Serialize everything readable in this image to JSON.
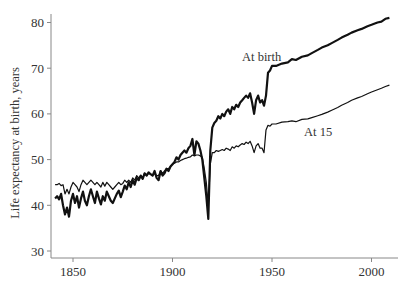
{
  "chart_data": {
    "type": "line",
    "title": "",
    "xlabel": "",
    "ylabel": "Life expectancy at birth, years",
    "xlim": [
      1840,
      2010
    ],
    "ylim": [
      30,
      82
    ],
    "x_ticks": [
      1850,
      1900,
      1950,
      2000
    ],
    "y_ticks": [
      30,
      40,
      50,
      60,
      70,
      80
    ],
    "grid": false,
    "legend": "none (inline annotations)",
    "annotations": [
      {
        "text": "At birth",
        "x": 1937,
        "y": 71.5
      },
      {
        "text": "At 15",
        "x": 1962,
        "y": 53.5
      }
    ],
    "series": [
      {
        "name": "At birth",
        "stroke_width": 2.2,
        "color": "#111111",
        "points": [
          [
            1841,
            41.5
          ],
          [
            1842,
            42
          ],
          [
            1843,
            41.3
          ],
          [
            1844,
            42.5
          ],
          [
            1845,
            40
          ],
          [
            1846,
            38
          ],
          [
            1847,
            39.5
          ],
          [
            1848,
            37.5
          ],
          [
            1849,
            41
          ],
          [
            1850,
            42.5
          ],
          [
            1851,
            40.5
          ],
          [
            1852,
            42
          ],
          [
            1853,
            39.5
          ],
          [
            1854,
            41.5
          ],
          [
            1855,
            43
          ],
          [
            1856,
            41
          ],
          [
            1857,
            40
          ],
          [
            1858,
            42
          ],
          [
            1859,
            43.5
          ],
          [
            1860,
            42
          ],
          [
            1861,
            40.5
          ],
          [
            1862,
            43
          ],
          [
            1863,
            41.5
          ],
          [
            1864,
            40.2
          ],
          [
            1865,
            42
          ],
          [
            1866,
            41
          ],
          [
            1867,
            43
          ],
          [
            1868,
            42
          ],
          [
            1869,
            41
          ],
          [
            1870,
            40.5
          ],
          [
            1871,
            41.5
          ],
          [
            1872,
            42.5
          ],
          [
            1873,
            43.2
          ],
          [
            1874,
            41.8
          ],
          [
            1875,
            43
          ],
          [
            1876,
            44.3
          ],
          [
            1877,
            43.5
          ],
          [
            1878,
            45
          ],
          [
            1879,
            44
          ],
          [
            1880,
            45.5
          ],
          [
            1881,
            44.5
          ],
          [
            1882,
            46
          ],
          [
            1883,
            45.5
          ],
          [
            1884,
            46.5
          ],
          [
            1885,
            45.8
          ],
          [
            1886,
            47
          ],
          [
            1887,
            46.5
          ],
          [
            1888,
            47.2
          ],
          [
            1889,
            46.8
          ],
          [
            1890,
            46.5
          ],
          [
            1891,
            47.5
          ],
          [
            1892,
            46
          ],
          [
            1893,
            45.5
          ],
          [
            1894,
            47.5
          ],
          [
            1895,
            46.5
          ],
          [
            1896,
            47
          ],
          [
            1897,
            48
          ],
          [
            1898,
            47.5
          ],
          [
            1899,
            48.5
          ],
          [
            1900,
            49
          ],
          [
            1901,
            49.5
          ],
          [
            1902,
            50.5
          ],
          [
            1903,
            50
          ],
          [
            1904,
            51
          ],
          [
            1905,
            51.5
          ],
          [
            1906,
            52
          ],
          [
            1907,
            51.5
          ],
          [
            1908,
            52.5
          ],
          [
            1909,
            53
          ],
          [
            1910,
            54.5
          ],
          [
            1911,
            51
          ],
          [
            1912,
            54
          ],
          [
            1913,
            53.5
          ],
          [
            1914,
            52
          ],
          [
            1915,
            50
          ],
          [
            1916,
            46
          ],
          [
            1917,
            42
          ],
          [
            1918,
            37
          ],
          [
            1919,
            52
          ],
          [
            1920,
            57
          ],
          [
            1921,
            58
          ],
          [
            1922,
            58.5
          ],
          [
            1923,
            59.5
          ],
          [
            1924,
            59
          ],
          [
            1925,
            60
          ],
          [
            1926,
            59.5
          ],
          [
            1927,
            60.5
          ],
          [
            1928,
            61
          ],
          [
            1929,
            60
          ],
          [
            1930,
            61.5
          ],
          [
            1931,
            61
          ],
          [
            1932,
            62
          ],
          [
            1933,
            61.5
          ],
          [
            1934,
            62.5
          ],
          [
            1935,
            63
          ],
          [
            1936,
            63.5
          ],
          [
            1937,
            64
          ],
          [
            1938,
            63.5
          ],
          [
            1939,
            64.5
          ],
          [
            1940,
            62.5
          ],
          [
            1941,
            60
          ],
          [
            1942,
            63
          ],
          [
            1943,
            64
          ],
          [
            1944,
            62.5
          ],
          [
            1945,
            63
          ],
          [
            1946,
            61.8
          ],
          [
            1947,
            64
          ],
          [
            1948,
            69
          ],
          [
            1949,
            69.5
          ],
          [
            1950,
            70.5
          ],
          [
            1952,
            70.5
          ],
          [
            1955,
            71
          ],
          [
            1958,
            71.3
          ],
          [
            1960,
            72
          ],
          [
            1962,
            71.8
          ],
          [
            1965,
            72.5
          ],
          [
            1968,
            72.8
          ],
          [
            1970,
            73.3
          ],
          [
            1973,
            74
          ],
          [
            1975,
            74.5
          ],
          [
            1978,
            75
          ],
          [
            1980,
            75.5
          ],
          [
            1983,
            76.2
          ],
          [
            1985,
            76.7
          ],
          [
            1988,
            77.3
          ],
          [
            1990,
            77.8
          ],
          [
            1993,
            78.3
          ],
          [
            1995,
            78.6
          ],
          [
            1998,
            79.2
          ],
          [
            2000,
            79.5
          ],
          [
            2003,
            80
          ],
          [
            2005,
            80.2
          ],
          [
            2007,
            80.8
          ],
          [
            2009,
            81
          ]
        ]
      },
      {
        "name": "At 15",
        "stroke_width": 1.2,
        "color": "#111111",
        "points": [
          [
            1841,
            44.5
          ],
          [
            1842,
            44.5
          ],
          [
            1843,
            44.8
          ],
          [
            1844,
            44.3
          ],
          [
            1845,
            44.5
          ],
          [
            1846,
            42.5
          ],
          [
            1847,
            43.5
          ],
          [
            1848,
            42.5
          ],
          [
            1849,
            44
          ],
          [
            1850,
            45
          ],
          [
            1851,
            44.5
          ],
          [
            1852,
            44
          ],
          [
            1853,
            43
          ],
          [
            1854,
            44.5
          ],
          [
            1855,
            45.5
          ],
          [
            1856,
            45
          ],
          [
            1857,
            44.5
          ],
          [
            1858,
            45
          ],
          [
            1859,
            45.5
          ],
          [
            1860,
            45
          ],
          [
            1861,
            44.5
          ],
          [
            1862,
            45
          ],
          [
            1863,
            44.5
          ],
          [
            1864,
            44
          ],
          [
            1865,
            45
          ],
          [
            1866,
            44.2
          ],
          [
            1867,
            45
          ],
          [
            1868,
            44.5
          ],
          [
            1869,
            44
          ],
          [
            1870,
            43.5
          ],
          [
            1871,
            44
          ],
          [
            1872,
            44.5
          ],
          [
            1873,
            45
          ],
          [
            1874,
            44.5
          ],
          [
            1875,
            44.8
          ],
          [
            1876,
            45.5
          ],
          [
            1877,
            45
          ],
          [
            1878,
            45.5
          ],
          [
            1879,
            45
          ],
          [
            1880,
            46
          ],
          [
            1881,
            45.5
          ],
          [
            1882,
            46.5
          ],
          [
            1883,
            46
          ],
          [
            1884,
            46.5
          ],
          [
            1885,
            46
          ],
          [
            1886,
            47
          ],
          [
            1887,
            46.5
          ],
          [
            1888,
            47
          ],
          [
            1889,
            46.8
          ],
          [
            1890,
            46.5
          ],
          [
            1891,
            47
          ],
          [
            1892,
            46.5
          ],
          [
            1893,
            46.5
          ],
          [
            1894,
            47.5
          ],
          [
            1895,
            47
          ],
          [
            1896,
            47.5
          ],
          [
            1897,
            48
          ],
          [
            1898,
            48
          ],
          [
            1899,
            48.5
          ],
          [
            1900,
            49
          ],
          [
            1901,
            49.2
          ],
          [
            1902,
            49.5
          ],
          [
            1903,
            49.5
          ],
          [
            1904,
            49.8
          ],
          [
            1905,
            50
          ],
          [
            1906,
            50.2
          ],
          [
            1907,
            50.3
          ],
          [
            1908,
            50.5
          ],
          [
            1909,
            50.6
          ],
          [
            1910,
            51
          ],
          [
            1911,
            50.8
          ],
          [
            1912,
            51
          ],
          [
            1913,
            51
          ],
          [
            1914,
            50.8
          ],
          [
            1915,
            50.5
          ],
          [
            1916,
            48
          ],
          [
            1917,
            45
          ],
          [
            1918,
            40
          ],
          [
            1919,
            49
          ],
          [
            1920,
            51.5
          ],
          [
            1921,
            51.5
          ],
          [
            1922,
            52
          ],
          [
            1923,
            51.8
          ],
          [
            1924,
            52
          ],
          [
            1925,
            52.2
          ],
          [
            1926,
            52
          ],
          [
            1927,
            52.5
          ],
          [
            1928,
            52.3
          ],
          [
            1929,
            52
          ],
          [
            1930,
            52.8
          ],
          [
            1931,
            52.5
          ],
          [
            1932,
            53
          ],
          [
            1933,
            52.8
          ],
          [
            1934,
            53.2
          ],
          [
            1935,
            53.5
          ],
          [
            1936,
            53.3
          ],
          [
            1937,
            53.8
          ],
          [
            1938,
            53.5
          ],
          [
            1939,
            54
          ],
          [
            1940,
            53
          ],
          [
            1941,
            51.5
          ],
          [
            1942,
            53
          ],
          [
            1943,
            53.5
          ],
          [
            1944,
            52.5
          ],
          [
            1945,
            52.5
          ],
          [
            1946,
            51.5
          ],
          [
            1947,
            56.5
          ],
          [
            1948,
            57.5
          ],
          [
            1949,
            57.3
          ],
          [
            1950,
            57.8
          ],
          [
            1952,
            57.8
          ],
          [
            1955,
            58.2
          ],
          [
            1958,
            58.3
          ],
          [
            1960,
            58.5
          ],
          [
            1962,
            58.3
          ],
          [
            1965,
            58.8
          ],
          [
            1968,
            58.9
          ],
          [
            1970,
            59.2
          ],
          [
            1973,
            59.6
          ],
          [
            1975,
            59.9
          ],
          [
            1978,
            60.4
          ],
          [
            1980,
            60.8
          ],
          [
            1983,
            61.4
          ],
          [
            1985,
            61.9
          ],
          [
            1988,
            62.5
          ],
          [
            1990,
            63
          ],
          [
            1993,
            63.5
          ],
          [
            1995,
            63.8
          ],
          [
            1998,
            64.4
          ],
          [
            2000,
            64.8
          ],
          [
            2003,
            65.3
          ],
          [
            2005,
            65.6
          ],
          [
            2007,
            66
          ],
          [
            2009,
            66.3
          ]
        ]
      }
    ]
  },
  "axes": {
    "y_label": "Life expectancy at birth, years",
    "x_tick_labels": [
      "1850",
      "1900",
      "1950",
      "2000"
    ],
    "y_tick_labels": [
      "30",
      "40",
      "50",
      "60",
      "70",
      "80"
    ]
  },
  "labels": {
    "at_birth": "At birth",
    "at_15": "At 15"
  }
}
